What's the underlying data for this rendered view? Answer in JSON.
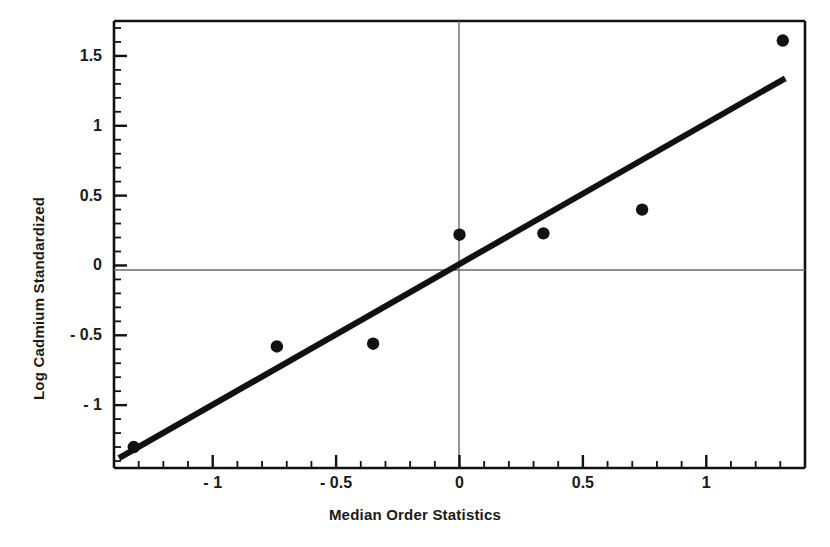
{
  "chart_data": {
    "type": "scatter",
    "title": "",
    "xlabel": "Median Order Statistics",
    "ylabel": "Log Cadmium Standardized",
    "xlim": [
      -1.4,
      1.4
    ],
    "ylim": [
      -1.45,
      1.75
    ],
    "grid": false,
    "legend": null,
    "x_ticks": [
      -1,
      -0.5,
      0,
      0.5,
      1
    ],
    "x_tick_labels": [
      "- 1",
      "- 0.5",
      "0",
      "0.5",
      "1"
    ],
    "y_ticks": [
      -1,
      -0.5,
      0,
      0.5,
      1,
      1.5
    ],
    "y_tick_labels": [
      "- 1",
      "- 0.5",
      "0",
      "0.5",
      "1",
      "1.5"
    ],
    "x_minor_tick_step": 0.1,
    "y_minor_tick_step": 0.1,
    "reference_lines": [
      {
        "name": "zero-horizontal",
        "orientation": "horizontal",
        "value": 0
      },
      {
        "name": "zero-vertical",
        "orientation": "vertical",
        "value": 0
      }
    ],
    "series": [
      {
        "name": "data-points",
        "type": "scatter",
        "marker": "filled-circle",
        "color": "#111111",
        "x": [
          -1.32,
          -0.74,
          -0.35,
          0.0,
          0.34,
          0.74,
          1.31
        ],
        "y": [
          -1.3,
          -0.58,
          -0.56,
          0.22,
          0.23,
          0.4,
          1.61
        ]
      },
      {
        "name": "fit-line",
        "type": "line",
        "color": "#111111",
        "linewidth": 6,
        "x": [
          -1.38,
          1.32
        ],
        "y": [
          -1.38,
          1.34
        ]
      }
    ]
  },
  "axes": {
    "x_title": "Median Order Statistics",
    "y_title": "Log Cadmium Standardized"
  },
  "colors": {
    "foreground": "#111111",
    "background": "#ffffff",
    "reference_line": "#555555"
  }
}
